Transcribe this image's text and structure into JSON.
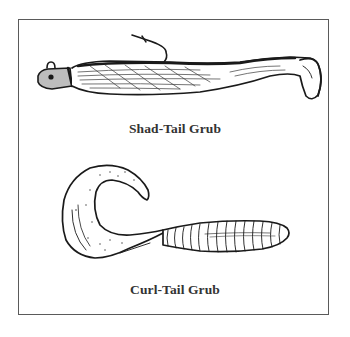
{
  "figure": {
    "border_color": "#5a5a5a",
    "items": [
      {
        "name": "shad-tail",
        "caption": "Shad-Tail Grub"
      },
      {
        "name": "curl-tail",
        "caption": "Curl-Tail Grub"
      }
    ]
  }
}
